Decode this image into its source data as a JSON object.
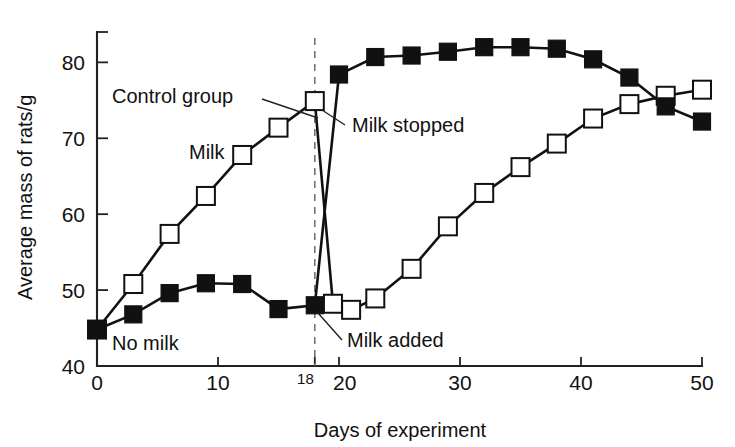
{
  "chart_data": {
    "type": "line",
    "title": "",
    "xlabel": "Days of experiment",
    "ylabel": "Average mass of rats/g",
    "xlim": [
      0,
      50
    ],
    "ylim": [
      40,
      84
    ],
    "grid": false,
    "legend_position": "inline-annotations",
    "xticks": [
      0,
      10,
      18,
      20,
      30,
      40,
      50
    ],
    "xtick_labels": [
      "0",
      "10",
      "18",
      "20",
      "30",
      "40",
      "50"
    ],
    "yticks": [
      40,
      50,
      60,
      70,
      80
    ],
    "ytick_labels": [
      "40",
      "50",
      "60",
      "70",
      "80"
    ],
    "series": [
      {
        "name": "Control group",
        "marker": "open-square",
        "description": "Rats given milk from day 0 until day 18, milk stopped, then milk added again at day 21",
        "points": [
          {
            "x": 0,
            "y": 44.8
          },
          {
            "x": 3,
            "y": 50.8
          },
          {
            "x": 6,
            "y": 57.4
          },
          {
            "x": 9,
            "y": 62.4
          },
          {
            "x": 12,
            "y": 67.8
          },
          {
            "x": 15,
            "y": 71.4
          },
          {
            "x": 18,
            "y": 74.9
          },
          {
            "x": 19.5,
            "y": 48.2
          },
          {
            "x": 21,
            "y": 47.4
          },
          {
            "x": 23,
            "y": 48.9
          },
          {
            "x": 26,
            "y": 52.8
          },
          {
            "x": 29,
            "y": 58.4
          },
          {
            "x": 32,
            "y": 62.8
          },
          {
            "x": 35,
            "y": 66.2
          },
          {
            "x": 38,
            "y": 69.3
          },
          {
            "x": 41,
            "y": 72.6
          },
          {
            "x": 44,
            "y": 74.5
          },
          {
            "x": 47,
            "y": 75.6
          },
          {
            "x": 50,
            "y": 76.4
          }
        ]
      },
      {
        "name": "No milk group",
        "marker": "filled-square",
        "description": "Rats given no milk until day 18, then milk supplied from day 18 onwards",
        "points": [
          {
            "x": 0,
            "y": 44.8
          },
          {
            "x": 3,
            "y": 46.8
          },
          {
            "x": 6,
            "y": 49.6
          },
          {
            "x": 9,
            "y": 50.9
          },
          {
            "x": 12,
            "y": 50.8
          },
          {
            "x": 15,
            "y": 47.5
          },
          {
            "x": 18,
            "y": 48.0
          },
          {
            "x": 20,
            "y": 78.4
          },
          {
            "x": 23,
            "y": 80.7
          },
          {
            "x": 26,
            "y": 80.9
          },
          {
            "x": 29,
            "y": 81.4
          },
          {
            "x": 32,
            "y": 82.0
          },
          {
            "x": 35,
            "y": 82.0
          },
          {
            "x": 38,
            "y": 81.8
          },
          {
            "x": 41,
            "y": 80.4
          },
          {
            "x": 44,
            "y": 78.0
          },
          {
            "x": 47,
            "y": 74.2
          },
          {
            "x": 50,
            "y": 72.2
          }
        ]
      }
    ],
    "annotations": [
      {
        "id": "control-group",
        "text": "Control group",
        "text_x": 112,
        "text_y": 103,
        "anchor": "start",
        "leader": [
          [
            262,
            99
          ],
          [
            318,
            118
          ]
        ]
      },
      {
        "id": "milk",
        "text": "Milk",
        "text_x": 189,
        "text_y": 159,
        "anchor": "start",
        "leader": null
      },
      {
        "id": "milk-stopped",
        "text": "Milk stopped",
        "text_x": 352,
        "text_y": 132,
        "anchor": "start",
        "leader": [
          [
            345,
            125
          ],
          [
            322,
            110
          ]
        ]
      },
      {
        "id": "milk-added",
        "text": "Milk added",
        "text_x": 347,
        "text_y": 347,
        "anchor": "start",
        "leader": [
          [
            342,
            340
          ],
          [
            318,
            313
          ]
        ]
      },
      {
        "id": "no-milk",
        "text": "No milk",
        "text_x": 112,
        "text_y": 350,
        "anchor": "start",
        "leader": null
      }
    ],
    "event_line": {
      "label": "18",
      "x_value": 18,
      "style": "dashed-vertical"
    }
  }
}
